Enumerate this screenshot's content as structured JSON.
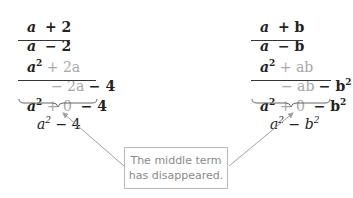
{
  "left": {
    "row1": {
      "a": "a",
      "op": "+ 2"
    },
    "row2": {
      "a": "a",
      "op": "− 2"
    },
    "row3": {
      "a": "a",
      "exp": "2",
      "rest": "+ 2a"
    },
    "row4": {
      "mid": "− 2a",
      "end": "− 4"
    },
    "row5": {
      "a": "a",
      "exp": "2",
      "zero": "+ 0",
      "end": "− 4"
    },
    "result": {
      "base": "a",
      "exp": "2",
      "rest": "− 4"
    }
  },
  "right": {
    "row1": {
      "a": "a",
      "op": "+ b"
    },
    "row2": {
      "a": "a",
      "op": "− b"
    },
    "row3": {
      "a": "a",
      "exp": "2",
      "rest": "+ ab"
    },
    "row4": {
      "mid": "− ab",
      "end": "− b",
      "end_exp": "2"
    },
    "row5": {
      "a": "a",
      "exp": "2",
      "zero": "+ 0",
      "end": "− b",
      "end_exp": "2"
    },
    "result": {
      "base": "a",
      "exp": "2",
      "op": "−",
      "b": "b",
      "b_exp": "2"
    }
  },
  "note": {
    "line1": "The middle term",
    "line2": "has disappeared."
  },
  "colors": {
    "text": "#222222",
    "faded": "#a8a8a8",
    "arrow": "#a0a0a0",
    "box_border": "#b8b8b8"
  }
}
